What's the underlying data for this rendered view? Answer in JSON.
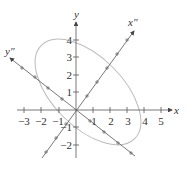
{
  "figure": {
    "type": "rotated-axes-ellipse",
    "axes": {
      "x_label": "x",
      "y_label": "y",
      "rotated_x_label": "x″",
      "rotated_y_label": "y″"
    },
    "x_ticks": [
      "−3",
      "−2",
      "−1",
      "1",
      "2",
      "3",
      "4",
      "5"
    ],
    "y_ticks": [
      "4",
      "3",
      "2",
      "1",
      "−1",
      "−2"
    ],
    "colors": {
      "axis": "#555555",
      "ellipse": "#bbbbbb"
    }
  }
}
